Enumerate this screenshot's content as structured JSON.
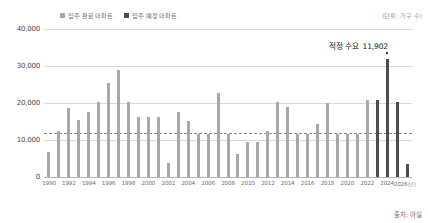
{
  "legend": {
    "items": [
      {
        "label": "입주 완료 아파트",
        "color": "#a8a8a8",
        "name": "legend-completed"
      },
      {
        "label": "입주 예정 아파트",
        "color": "#4d4d4d",
        "name": "legend-scheduled"
      }
    ]
  },
  "unit_label": "(단위: 가구 수)",
  "source_label": "출처: 아실",
  "annotation": {
    "text": "적정 수요",
    "value": "11,902"
  },
  "chart_data": {
    "type": "bar",
    "title": "",
    "subtitle": "",
    "xlabel": "(년)",
    "ylabel": "",
    "unit": "(단위: 가구 수)",
    "source": "출처: 아실",
    "ylim": [
      0,
      40000
    ],
    "yticks": [
      0,
      10000,
      20000,
      30000,
      40000
    ],
    "ytick_labels": [
      "0",
      "10,000",
      "20,000",
      "30,000",
      "40,000"
    ],
    "grid": true,
    "legend_position": "top-left",
    "xtick_labels": [
      "1990",
      "1992",
      "1994",
      "1996",
      "1998",
      "2000",
      "2002",
      "2004",
      "2006",
      "2008",
      "2010",
      "2012",
      "2014",
      "2016",
      "2018",
      "2020",
      "2022",
      "2024",
      "2026"
    ],
    "threshold": {
      "label": "적정 수요",
      "value": 11902,
      "style": "dashed"
    },
    "categories": [
      "1990",
      "1991",
      "1992",
      "1993",
      "1994",
      "1995",
      "1996",
      "1997",
      "1998",
      "1999",
      "2000",
      "2001",
      "2002",
      "2003",
      "2004",
      "2005",
      "2006",
      "2007",
      "2008",
      "2009",
      "2010",
      "2011",
      "2012",
      "2013",
      "2014",
      "2015",
      "2016",
      "2017",
      "2018",
      "2019",
      "2020",
      "2021",
      "2022",
      "2023",
      "2024",
      "2025",
      "2026"
    ],
    "values": [
      6800,
      12400,
      18600,
      15300,
      17500,
      20300,
      25400,
      28800,
      20400,
      16200,
      16300,
      16300,
      3900,
      17600,
      15100,
      11600,
      11500,
      22800,
      11700,
      6200,
      9400,
      9500,
      12400,
      20200,
      18900,
      11500,
      11600,
      14200,
      20100,
      11700,
      11600,
      11600,
      20800,
      20900,
      31800,
      20400,
      3500
    ],
    "series": [
      {
        "name": "입주 완료 아파트",
        "color": "#a8a8a8",
        "range": "1990-2022"
      },
      {
        "name": "입주 예정 아파트",
        "color": "#4d4d4d",
        "range": "2023-2026"
      }
    ],
    "scheduled_start_year": "2023"
  }
}
